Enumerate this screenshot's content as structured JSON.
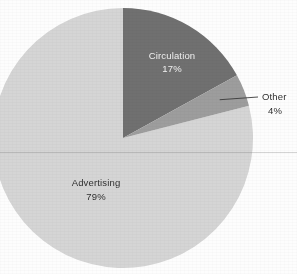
{
  "chart_data": {
    "type": "pie",
    "title": "",
    "subtitle": "",
    "xlabel": "",
    "ylabel": "",
    "legend_position": "none",
    "grid": false,
    "start_angle_deg": 0,
    "direction": "clockwise",
    "categories": [
      "Circulation",
      "Other",
      "Advertising"
    ],
    "values": [
      17,
      4,
      79
    ],
    "value_unit": "%",
    "colors": [
      "#6f6f6f",
      "#9d9d9d",
      "#d5d5d5"
    ],
    "slices": [
      {
        "name": "Circulation",
        "label": "Circulation",
        "value": 17,
        "value_label": "17%",
        "color": "#6f6f6f",
        "label_placement": "inside",
        "label_color": "#f2f2f2"
      },
      {
        "name": "Other",
        "label": "Other",
        "value": 4,
        "value_label": "4%",
        "color": "#9d9d9d",
        "label_placement": "outside",
        "label_color": "#2f2f2f",
        "has_leader_line": true
      },
      {
        "name": "Advertising",
        "label": "Advertising",
        "value": 79,
        "value_label": "79%",
        "color": "#d5d5d5",
        "label_placement": "inside",
        "label_color": "#2f2f2f"
      }
    ]
  },
  "figure": {
    "background_color": "#fdfdfd",
    "pie_center_x": 123,
    "pie_center_y": 138,
    "pie_radius": 130
  }
}
